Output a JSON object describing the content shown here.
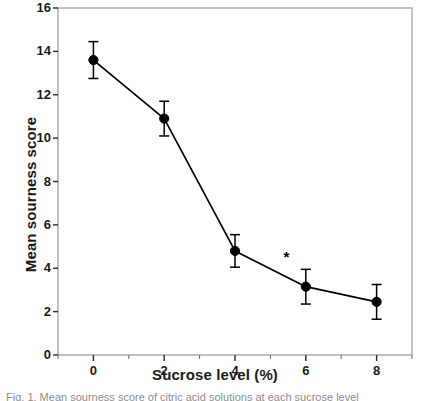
{
  "chart_data": {
    "type": "line",
    "title": "",
    "xlabel": "Sucrose level (%)",
    "ylabel": "Mean sourness score",
    "x": [
      0,
      2,
      4,
      6,
      8
    ],
    "categories": [
      "0",
      "2",
      "4",
      "6",
      "8"
    ],
    "series": [
      {
        "name": "Mean sourness score",
        "values": [
          13.6,
          10.9,
          4.8,
          3.15,
          2.45
        ],
        "errors": [
          0.85,
          0.8,
          0.75,
          0.8,
          0.8
        ]
      }
    ],
    "xlim": [
      -1,
      9
    ],
    "ylim": [
      0,
      16
    ],
    "xticks": [
      0,
      2,
      4,
      6,
      8
    ],
    "xtick_labels": [
      "0",
      "2",
      "4",
      "6",
      "8"
    ],
    "yticks": [
      0,
      2,
      4,
      6,
      8,
      10,
      12,
      14,
      16
    ],
    "ytick_labels": [
      "0",
      "2",
      "4",
      "6",
      "8",
      "10",
      "12",
      "14",
      "16"
    ],
    "grid": false,
    "legend": false,
    "marker": "filled-circle",
    "line_color": "#000000",
    "marker_color": "#000000",
    "annotations": [
      {
        "text": "*",
        "x": 5.45,
        "y": 4.3
      }
    ]
  },
  "caption": {
    "text": "Fig. 1. Mean sourness score of citric acid solutions at each sucrose level"
  }
}
